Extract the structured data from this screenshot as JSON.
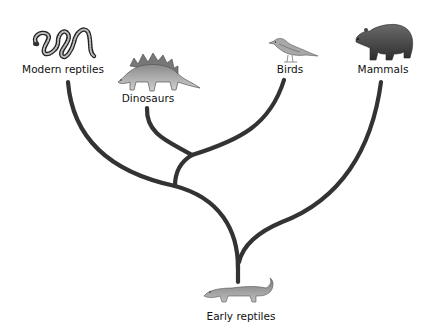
{
  "diagram": {
    "type": "phylogenetic-tree",
    "root": {
      "label": "Early reptiles",
      "icon": "early-reptile-icon"
    },
    "leaves": [
      {
        "label": "Modern reptiles",
        "icon": "snake-icon"
      },
      {
        "label": "Dinosaurs",
        "icon": "stegosaurus-icon"
      },
      {
        "label": "Birds",
        "icon": "bird-icon"
      },
      {
        "label": "Mammals",
        "icon": "bear-icon"
      }
    ],
    "branch_color": "#333333",
    "structure": "((Modern reptiles, (Dinosaurs, Birds)), Mammals) <- Early reptiles"
  }
}
